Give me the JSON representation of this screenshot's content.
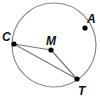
{
  "diagram": {
    "type": "circle-geometry",
    "circle": {
      "center": "M",
      "cx": 54,
      "cy": 45,
      "r": 42,
      "stroke": "#8a8a8a"
    },
    "points": [
      {
        "name": "C",
        "x": 14,
        "y": 44,
        "label_x": 2,
        "label_y": 40
      },
      {
        "name": "M",
        "x": 51,
        "y": 50,
        "label_x": 47,
        "label_y": 45
      },
      {
        "name": "A",
        "x": 85,
        "y": 28,
        "label_x": 88,
        "label_y": 24
      },
      {
        "name": "T",
        "x": 77,
        "y": 79,
        "label_x": 79,
        "label_y": 96
      }
    ],
    "segments": [
      {
        "from": "C",
        "to": "M"
      },
      {
        "from": "M",
        "to": "T"
      },
      {
        "from": "C",
        "to": "T"
      }
    ],
    "labels": {
      "C": "C",
      "M": "M",
      "A": "A",
      "T": "T"
    }
  }
}
